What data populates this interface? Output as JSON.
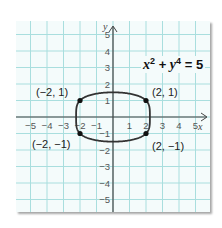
{
  "chart_data": {
    "type": "line",
    "equation": {
      "x": "x",
      "xexp": "2",
      "plus": "+",
      "y": "y",
      "yexp": "4",
      "eq": "= 5"
    },
    "xlabel": "x",
    "ylabel": "y",
    "xlim": [
      -5.5,
      5.5
    ],
    "ylim": [
      -5.5,
      5.5
    ],
    "grid": true,
    "x_ticks": [
      "−5",
      "−4",
      "−3",
      "−2",
      "−1",
      "1",
      "2",
      "3",
      "4",
      "5"
    ],
    "y_ticks": [
      "5",
      "4",
      "3",
      "2",
      "1",
      "−1",
      "−2",
      "−3",
      "−4",
      "−5"
    ],
    "curve": "closed curve x^2 + y^4 = 5",
    "points": [
      {
        "x": -2,
        "y": 1,
        "label": "(−2, 1)"
      },
      {
        "x": 2,
        "y": 1,
        "label": "(2, 1)"
      },
      {
        "x": -2,
        "y": -1,
        "label": "(−2, −1)"
      },
      {
        "x": 2,
        "y": -1,
        "label": "(2, −1)"
      }
    ],
    "colors": {
      "grid": "#a9dede",
      "background": "#f4fbfb",
      "axis": "#444444",
      "curve": "#333333"
    }
  }
}
